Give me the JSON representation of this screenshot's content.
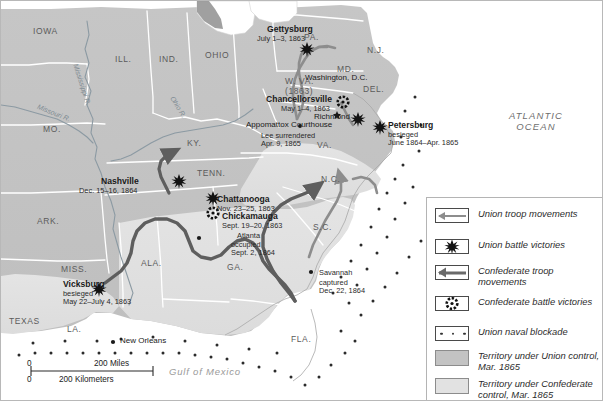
{
  "map": {
    "title": "American Civil War Map 1861-1865",
    "ocean_label": "ATLANTIC\nOCEAN",
    "gulf_label": "Gulf of Mexico",
    "rivers": [
      {
        "name": "Mississippi R."
      },
      {
        "name": "Missouri R."
      },
      {
        "name": "Ohio R."
      }
    ],
    "states": [
      {
        "abbr": "IOWA"
      },
      {
        "abbr": "ILL."
      },
      {
        "abbr": "IND."
      },
      {
        "abbr": "OHIO"
      },
      {
        "abbr": "PA."
      },
      {
        "abbr": "N.J."
      },
      {
        "abbr": "MD."
      },
      {
        "abbr": "DEL."
      },
      {
        "abbr": "MO."
      },
      {
        "abbr": "KY."
      },
      {
        "abbr": "W. VA.\n(1863)"
      },
      {
        "abbr": "VA."
      },
      {
        "abbr": "TENN."
      },
      {
        "abbr": "N.C."
      },
      {
        "abbr": "S.C."
      },
      {
        "abbr": "ARK."
      },
      {
        "abbr": "MISS."
      },
      {
        "abbr": "ALA."
      },
      {
        "abbr": "GA."
      },
      {
        "abbr": "TEXAS"
      },
      {
        "abbr": "LA."
      },
      {
        "abbr": "FLA."
      }
    ],
    "places": [
      {
        "name": "Gettysburg",
        "detail": "July 1–3, 1863"
      },
      {
        "name": "Washington, D.C.",
        "detail": ""
      },
      {
        "name": "Chancellorsville",
        "detail": "May 1–4, 1863"
      },
      {
        "name": "Richmond",
        "detail": ""
      },
      {
        "name": "Petersburg",
        "detail": "besieged\nJune 1864–Apr. 1865"
      },
      {
        "name": "Appomattox Courthouse",
        "detail": "Lee surrendered\nApr. 9, 1865"
      },
      {
        "name": "Nashville",
        "detail": "Dec. 15–16, 1864"
      },
      {
        "name": "Chattanooga",
        "detail": "Nov. 23–25, 1863"
      },
      {
        "name": "Chickamauga",
        "detail": "Sept. 19–20, 1863"
      },
      {
        "name": "Atlanta",
        "detail": "occupied\nSept. 2, 1864"
      },
      {
        "name": "Vicksburg",
        "detail": "besieged\nMay 22–July 4, 1863"
      },
      {
        "name": "Savannah",
        "detail": "captured\nDec. 22, 1864"
      },
      {
        "name": "New Orleans",
        "detail": ""
      }
    ],
    "scale": {
      "zero_top": "0",
      "miles": "200 Miles",
      "zero_bottom": "0",
      "kilometers": "200 Kilometers"
    }
  },
  "legend": {
    "items": [
      {
        "symbol": "union-arrow-icon",
        "label": "Union\ntroop movements"
      },
      {
        "symbol": "union-victory-icon",
        "label": "Union battle victories"
      },
      {
        "symbol": "confederate-arrow-icon",
        "label": "Confederate\ntroop movements"
      },
      {
        "symbol": "confederate-victory-icon",
        "label": "Confederate\nbattle victories"
      },
      {
        "symbol": "naval-blockade-icon",
        "label": "Union naval blockade"
      },
      {
        "symbol": "union-territory-swatch",
        "label": "Territory under\nUnion control, Mar. 1865"
      },
      {
        "symbol": "confederate-territory-swatch",
        "label": "Territory under\nConfederate control,\nMar. 1865"
      }
    ]
  },
  "colors": {
    "union_territory": "#c3c3c3",
    "confederate_territory": "#e2e2e2",
    "ocean": "#ffffff",
    "union_arrow": "#8d8d8d",
    "confederate_arrow": "#6a6a6a",
    "border": "#ffffff",
    "river": "#7d8a92"
  }
}
